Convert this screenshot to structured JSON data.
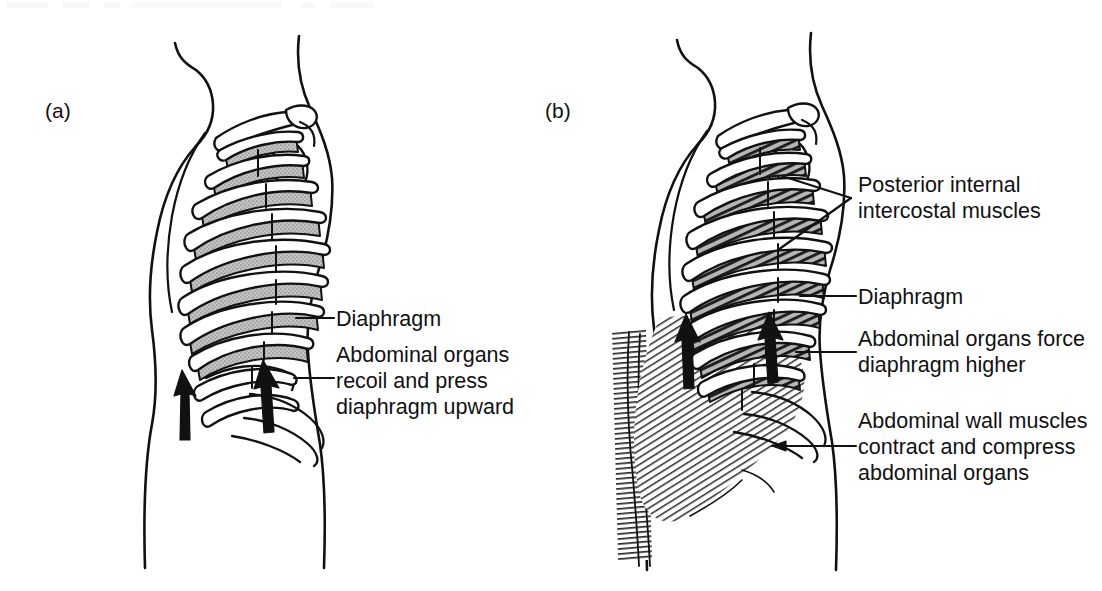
{
  "figure": {
    "type": "anatomical-diagram",
    "background_color": "#ffffff",
    "ink_color": "#111111",
    "relaxed_fill_color": "#b8b8b8",
    "contracted_fill_color": "#6f6f6f"
  },
  "panels": [
    {
      "tag": "(a)",
      "name": "quiet-expiration",
      "shading": "light grey stipple (relaxed intercostal muscles)",
      "callouts": [
        {
          "id": "diaphragm-a",
          "text": "Diaphragm",
          "lines": [
            "Diaphragm"
          ]
        },
        {
          "id": "abdominal-recoil",
          "text": "Abdominal organs recoil and press diaphragm upward",
          "lines": [
            "Abdominal organs",
            "recoil and press",
            "diaphragm upward"
          ]
        }
      ],
      "arrows": [
        {
          "name": "recoil-arrow-left",
          "direction": "up"
        },
        {
          "name": "recoil-arrow-right",
          "direction": "up"
        }
      ]
    },
    {
      "tag": "(b)",
      "name": "forced-expiration",
      "shading": "dark diagonal hatching (contracting intercostal muscles)",
      "callouts": [
        {
          "id": "posterior-intercostals",
          "text": "Posterior internal intercostal muscles",
          "lines": [
            "Posterior internal",
            "intercostal muscles"
          ]
        },
        {
          "id": "diaphragm-b",
          "text": "Diaphragm",
          "lines": [
            "Diaphragm"
          ]
        },
        {
          "id": "abdominal-force",
          "text": "Abdominal organs force diaphragm higher",
          "lines": [
            "Abdominal organs force",
            "diaphragm higher"
          ]
        },
        {
          "id": "abdominal-wall",
          "text": "Abdominal wall muscles contract and compress abdominal organs",
          "lines": [
            "Abdominal wall muscles",
            "contract and compress",
            "abdominal organs"
          ]
        }
      ],
      "arrows": [
        {
          "name": "force-arrow-left",
          "direction": "up"
        },
        {
          "name": "force-arrow-right",
          "direction": "up"
        }
      ]
    }
  ]
}
